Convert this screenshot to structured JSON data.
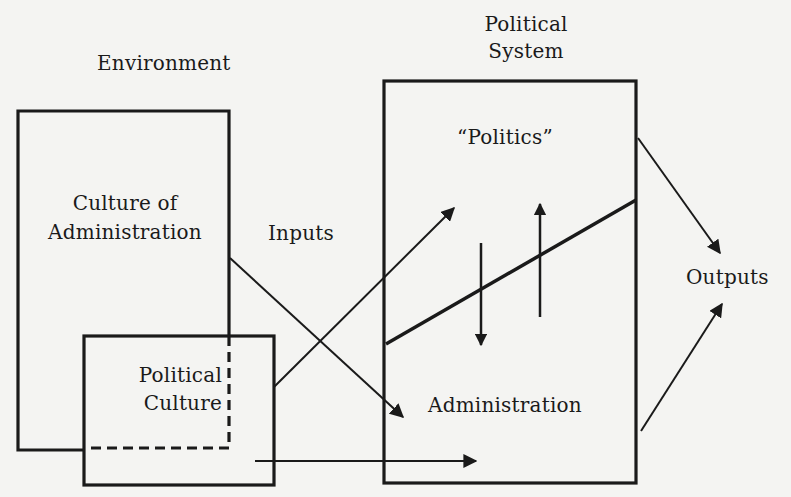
{
  "diagram": {
    "labels": {
      "environment": "Environment",
      "political_system_line1": "Political",
      "political_system_line2": "System",
      "politics": "“Politics”",
      "culture_of_admin_line1": "Culture of",
      "culture_of_admin_line2": "Administration",
      "inputs": "Inputs",
      "outputs": "Outputs",
      "political_culture_line1": "Political",
      "political_culture_line2": "Culture",
      "administration": "Administration"
    },
    "nodes": [
      {
        "id": "culture-of-administration",
        "label": "Culture of Administration",
        "container": "Environment"
      },
      {
        "id": "political-culture",
        "label": "Political Culture",
        "container": "Environment",
        "overlaps": "culture-of-administration"
      },
      {
        "id": "political-system",
        "label": "Political System",
        "contains": [
          "politics",
          "administration"
        ]
      },
      {
        "id": "politics",
        "label": "“Politics”"
      },
      {
        "id": "administration",
        "label": "Administration"
      },
      {
        "id": "outputs",
        "label": "Outputs"
      }
    ],
    "edges": [
      {
        "from": "culture-of-administration",
        "to": "administration",
        "label": "Inputs"
      },
      {
        "from": "political-culture",
        "to": "politics",
        "label": "Inputs"
      },
      {
        "from": "political-culture",
        "to": "administration"
      },
      {
        "from": "politics",
        "to": "administration",
        "direction": "down"
      },
      {
        "from": "administration",
        "to": "politics",
        "direction": "up"
      },
      {
        "from": "politics",
        "to": "outputs"
      },
      {
        "from": "administration",
        "to": "outputs"
      }
    ],
    "colors": {
      "background": "#f4f4f2",
      "ink": "#1a1a1a"
    }
  }
}
